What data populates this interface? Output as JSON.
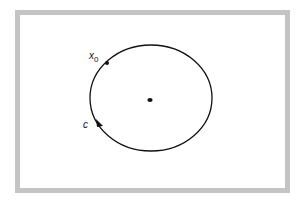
{
  "diagram": {
    "frame": {
      "border_color": "#c4c4c4",
      "background": "#ffffff"
    },
    "curve": {
      "name": "closed orbit",
      "label": "c",
      "color": "#111111"
    },
    "center_point": {
      "name": "equilibrium point"
    },
    "start_point": {
      "label": "x",
      "subscript": "0"
    }
  }
}
